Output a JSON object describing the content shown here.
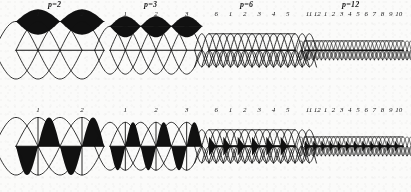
{
  "figure": {
    "kind": "multi-panel-winding-diagram",
    "background": "#fbfbfa",
    "ink": "#111111",
    "rows": 2,
    "columns": 4
  },
  "panels": [
    {
      "id": "p2-top",
      "title": "p=2",
      "row": "top",
      "pole_count": 2,
      "pole_labels": [
        "1",
        "2"
      ],
      "style": "flux-wave-filled-crest",
      "x": 16,
      "y": 20,
      "width": 88,
      "height": 72
    },
    {
      "id": "p3-top",
      "title": "p=3",
      "row": "top",
      "pole_count": 3,
      "pole_labels": [
        "1",
        "2",
        "3"
      ],
      "style": "flux-wave-filled-crest",
      "x": 110,
      "y": 20,
      "width": 92,
      "height": 72
    },
    {
      "id": "p6-top",
      "title": "p=6",
      "row": "top",
      "pole_count": 6,
      "pole_labels": [
        "6",
        "1",
        "2",
        "3",
        "4",
        "5"
      ],
      "style": "mesh-lattice",
      "x": 209,
      "y": 20,
      "width": 86,
      "height": 72
    },
    {
      "id": "p12-top",
      "title": "p=12",
      "row": "top",
      "pole_count": 12,
      "pole_labels": [
        "11",
        "12",
        "1",
        "2",
        "3",
        "4",
        "5",
        "6",
        "7",
        "8",
        "9",
        "10"
      ],
      "style": "mesh-lattice",
      "x": 305,
      "y": 20,
      "width": 98,
      "height": 72
    },
    {
      "id": "p2-bottom",
      "title": "",
      "row": "bottom",
      "pole_count": 2,
      "pole_labels": [
        "1",
        "2"
      ],
      "style": "checker-lens",
      "x": 16,
      "y": 116,
      "width": 88,
      "height": 72
    },
    {
      "id": "p3-bottom",
      "title": "",
      "row": "bottom",
      "pole_count": 3,
      "pole_labels": [
        "1",
        "2",
        "3"
      ],
      "style": "checker-lens",
      "x": 110,
      "y": 116,
      "width": 92,
      "height": 72
    },
    {
      "id": "p6-bottom",
      "title": "",
      "row": "bottom",
      "pole_count": 6,
      "pole_labels": [
        "6",
        "1",
        "2",
        "3",
        "4",
        "5"
      ],
      "style": "mesh-lattice-wedges",
      "x": 209,
      "y": 116,
      "width": 86,
      "height": 72
    },
    {
      "id": "p12-bottom",
      "title": "",
      "row": "bottom",
      "pole_count": 12,
      "pole_labels": [
        "11",
        "12",
        "1",
        "2",
        "3",
        "4",
        "5",
        "6",
        "7",
        "8",
        "9",
        "10"
      ],
      "style": "mesh-lattice-wedges",
      "x": 305,
      "y": 116,
      "width": 98,
      "height": 72
    }
  ],
  "chart_data": {
    "type": "line",
    "xlabel": "",
    "ylabel": "",
    "series": [
      {
        "name": "p=2",
        "poles": 2,
        "labels": [
          "1",
          "2"
        ]
      },
      {
        "name": "p=3",
        "poles": 3,
        "labels": [
          "1",
          "2",
          "3"
        ]
      },
      {
        "name": "p=6",
        "poles": 6,
        "labels": [
          "6",
          "1",
          "2",
          "3",
          "4",
          "5"
        ]
      },
      {
        "name": "p=12",
        "poles": 12,
        "labels": [
          "11",
          "12",
          "1",
          "2",
          "3",
          "4",
          "5",
          "6",
          "7",
          "8",
          "9",
          "10"
        ]
      }
    ]
  }
}
